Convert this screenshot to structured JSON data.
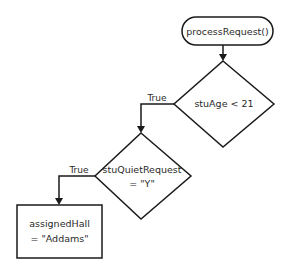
{
  "diagram": {
    "type": "flowchart",
    "nodes": {
      "start": {
        "shape": "terminal",
        "label": "processRequest()"
      },
      "decision1": {
        "shape": "decision",
        "label": "stuAge < 21"
      },
      "decision2": {
        "shape": "decision",
        "line1": "stuQuietRequest",
        "line2": "= \"Y\""
      },
      "process1": {
        "shape": "process",
        "line1": "assignedHall",
        "line2": "= \"Addams\""
      }
    },
    "edges": {
      "e1": {
        "from": "start",
        "to": "decision1",
        "label": ""
      },
      "e2": {
        "from": "decision1",
        "to": "decision2",
        "label": "True"
      },
      "e3": {
        "from": "decision2",
        "to": "process1",
        "label": "True"
      }
    },
    "colors": {
      "stroke": "#1a1a1a",
      "fill": "#ffffff",
      "text": "#2a2a2a"
    }
  }
}
